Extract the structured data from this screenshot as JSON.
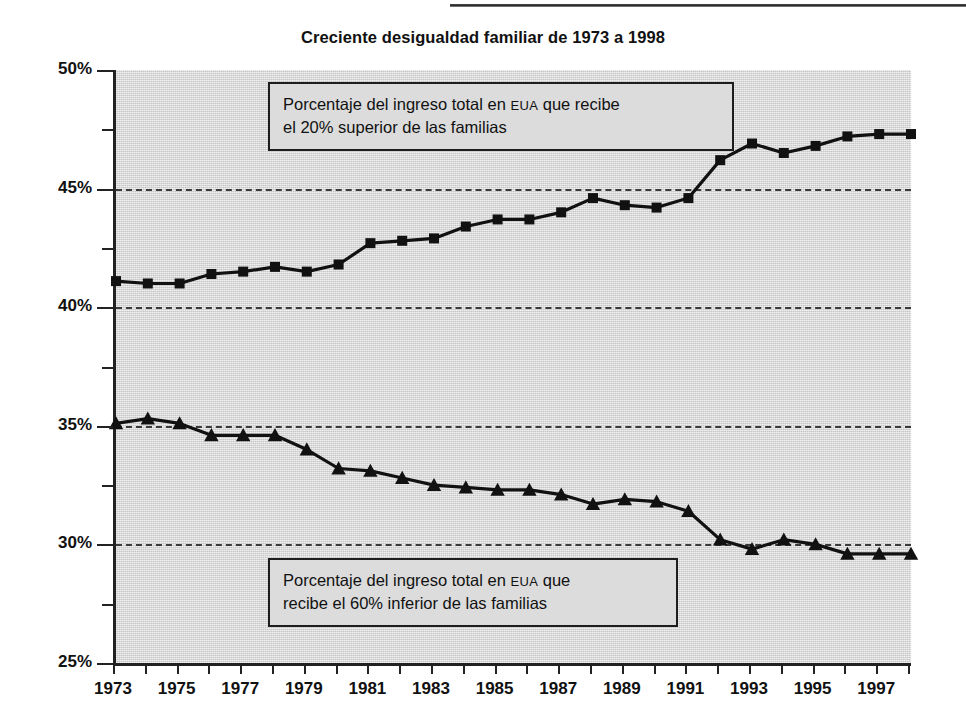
{
  "chart_data": {
    "type": "line",
    "title": "Creciente desigualdad familiar de 1973 a 1998",
    "xlabel": "",
    "ylabel": "",
    "xlim": [
      1973,
      1998
    ],
    "ylim": [
      25,
      50
    ],
    "grid": "horizontal dashed at 30%, 35%, 40%, 45%",
    "legend_position": "inline annotation boxes",
    "x": [
      1973,
      1974,
      1975,
      1976,
      1977,
      1978,
      1979,
      1980,
      1981,
      1982,
      1983,
      1984,
      1985,
      1986,
      1987,
      1988,
      1989,
      1990,
      1991,
      1992,
      1993,
      1994,
      1995,
      1996,
      1997,
      1998
    ],
    "xtick_labels": [
      "1973",
      "1975",
      "1977",
      "1979",
      "1981",
      "1983",
      "1985",
      "1987",
      "1989",
      "1991",
      "1993",
      "1995",
      "1997"
    ],
    "ytick_labels": [
      "50%",
      "45%",
      "40%",
      "35%",
      "30%",
      "25%"
    ],
    "ytick_values": [
      50,
      45,
      40,
      35,
      30,
      25
    ],
    "series": [
      {
        "name": "Porcentaje del ingreso total en EUA que recibe el 20% superior de las familias",
        "marker": "square",
        "values": [
          41.1,
          41.0,
          41.0,
          41.4,
          41.5,
          41.7,
          41.5,
          41.8,
          42.7,
          42.8,
          42.9,
          43.4,
          43.7,
          43.7,
          44.0,
          44.6,
          44.3,
          44.2,
          44.6,
          46.2,
          46.9,
          46.5,
          46.8,
          47.2,
          47.3,
          47.3
        ]
      },
      {
        "name": "Porcentaje del ingreso total en EUA que recibe el 60% inferior de las familias",
        "marker": "triangle",
        "values": [
          35.1,
          35.3,
          35.1,
          34.6,
          34.6,
          34.6,
          34.0,
          33.2,
          33.1,
          32.8,
          32.5,
          32.4,
          32.3,
          32.3,
          32.1,
          31.7,
          31.9,
          31.8,
          31.4,
          30.2,
          29.8,
          30.2,
          30.0,
          29.6,
          29.6,
          29.6
        ]
      }
    ]
  },
  "annotations": [
    {
      "id": "top",
      "line1_before": "Porcentaje del ingreso total en ",
      "line1_smallcaps": "EUA",
      "line1_after": " que recibe",
      "line2": "el 20% superior de las familias"
    },
    {
      "id": "bottom",
      "line1_before": "Porcentaje del ingreso total en ",
      "line1_smallcaps": "EUA",
      "line1_after": " que",
      "line2": "recibe el 60% inferior de las familias"
    }
  ],
  "style": {
    "line_color": "#111111",
    "plot_background": "#d9d9d9",
    "axis_color": "#222222",
    "grid_color": "#3a3a3a",
    "annotation_background": "#dcdcdc"
  }
}
